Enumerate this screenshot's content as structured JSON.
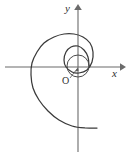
{
  "figure": {
    "kind": "math-diagram",
    "background_color": "#ffffff",
    "width": 129,
    "height": 157
  },
  "axes": {
    "x_axis": {
      "label": "x",
      "color": "#6b6b6b",
      "start_x": 5,
      "end_x": 124,
      "y": 67,
      "has_arrow": true,
      "arrow_direction": "right"
    },
    "y_axis": {
      "label": "y",
      "color": "#6b6b6b",
      "x": 78,
      "start_y": 150,
      "end_y": 6,
      "has_arrow": true,
      "arrow_direction": "up"
    },
    "origin": {
      "label": "O",
      "x": 78,
      "y": 67,
      "label_x": 62,
      "label_y": 76,
      "leader_line": true
    }
  },
  "curve": {
    "name": "spiral",
    "color": "#3a3a3a",
    "stroke_width": 1.25,
    "winding": "outward-clockwise",
    "start_point": [
      89,
      66
    ],
    "end_point": [
      97,
      128
    ],
    "inner_circle": {
      "center_x": 78,
      "center_y": 66,
      "radius": 11,
      "color": "#4a4a4a"
    },
    "extremes": {
      "leftmost_x": 30,
      "topmost_y": 33,
      "bottom_y": 128
    }
  },
  "chart_data": {
    "type": "line",
    "title": "",
    "xlabel": "x",
    "ylabel": "y",
    "grid": false,
    "legend": null,
    "annotations": [
      {
        "text": "O",
        "role": "origin-marker"
      },
      {
        "text": "x",
        "role": "x-axis-label"
      },
      {
        "text": "y",
        "role": "y-axis-label"
      }
    ],
    "series": [
      {
        "name": "spiral",
        "note": "Spiral expanding clockwise from a small circle around the origin",
        "points_svg": [
          [
            89,
            66
          ],
          [
            88,
            57
          ],
          [
            84,
            50
          ],
          [
            78,
            46
          ],
          [
            71,
            47
          ],
          [
            66,
            52
          ],
          [
            64,
            60
          ],
          [
            66,
            67
          ],
          [
            72,
            72
          ],
          [
            79,
            73
          ],
          [
            87,
            70
          ],
          [
            92,
            62
          ],
          [
            93,
            52
          ],
          [
            90,
            43
          ],
          [
            83,
            37
          ],
          [
            74,
            34
          ],
          [
            64,
            34
          ],
          [
            54,
            37
          ],
          [
            44,
            43
          ],
          [
            37,
            52
          ],
          [
            32,
            63
          ],
          [
            31,
            75
          ],
          [
            33,
            88
          ],
          [
            39,
            100
          ],
          [
            48,
            111
          ],
          [
            59,
            120
          ],
          [
            72,
            126
          ],
          [
            85,
            128
          ],
          [
            97,
            128
          ]
        ]
      }
    ],
    "inner_circle": {
      "name": "inner-circle",
      "center": [
        78,
        66
      ],
      "radius": 11
    }
  }
}
